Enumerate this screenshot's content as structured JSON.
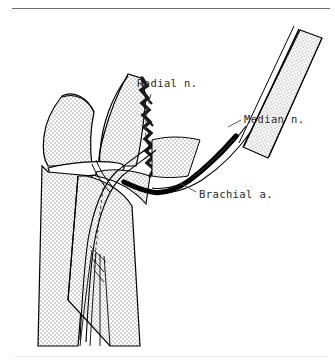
{
  "figure": {
    "background_color": "#ffffff",
    "ink_color": "#000000",
    "stipple_color": "#5a5a5a",
    "rule_color": "#6d6d6d",
    "rule_color_faint": "#e8e8e8"
  },
  "labels": [
    {
      "id": "radial",
      "text": "Radial n.",
      "structure": "radial nerve",
      "leader": "dashed",
      "x": 137,
      "y": 77
    },
    {
      "id": "median",
      "text": "Median n.",
      "structure": "median nerve",
      "leader": "solid",
      "x": 244,
      "y": 113
    },
    {
      "id": "brachial",
      "text": "Brachial a.",
      "structure": "brachial artery",
      "leader": "solid",
      "x": 199,
      "y": 188
    }
  ],
  "structures": [
    {
      "name": "humerus-shaft",
      "fill": "stipple"
    },
    {
      "name": "distal-humerus-condyle",
      "fill": "stipple"
    },
    {
      "name": "olecranon-ulna",
      "fill": "stipple"
    },
    {
      "name": "radius",
      "fill": "stipple"
    },
    {
      "name": "fracture-line",
      "fill": "solid-black"
    },
    {
      "name": "brachial-artery",
      "fill": "solid-black"
    },
    {
      "name": "median-nerve",
      "fill": "outline"
    },
    {
      "name": "radial-nerve",
      "fill": "outline"
    }
  ]
}
